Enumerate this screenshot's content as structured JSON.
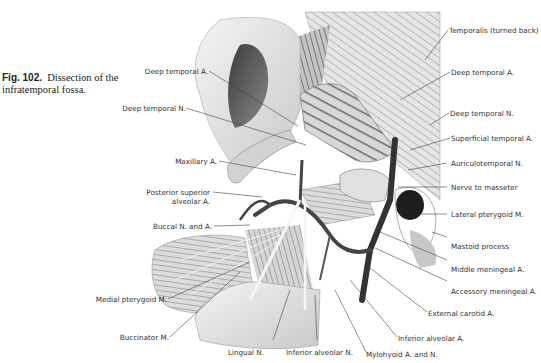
{
  "figure": {
    "number": "Fig. 102.",
    "caption": "Dissection of the infratemporal fossa."
  },
  "labels": {
    "left": [
      {
        "id": "deep-temporal-a-left",
        "text": "Deep temporal A."
      },
      {
        "id": "deep-temporal-n-left",
        "text": "Deep temporal N."
      },
      {
        "id": "maxillary-a",
        "text": "Maxillary A."
      },
      {
        "id": "posterior-superior-alveolar-a-1",
        "text": "Posterior superior"
      },
      {
        "id": "posterior-superior-alveolar-a-2",
        "text": "alveolar A."
      },
      {
        "id": "buccal-n-and-a",
        "text": "Buccal N. and A."
      },
      {
        "id": "medial-pterygoid-m",
        "text": "Medial pterygoid M."
      },
      {
        "id": "buccinator-m",
        "text": "Buccinator M."
      }
    ],
    "right": [
      {
        "id": "temporalis",
        "text": "Temporalis (turned back)"
      },
      {
        "id": "deep-temporal-a-right",
        "text": "Deep temporal A."
      },
      {
        "id": "deep-temporal-n-right",
        "text": "Deep temporal N."
      },
      {
        "id": "superficial-temporal-a",
        "text": "Superficial temporal A."
      },
      {
        "id": "auriculotemporal-n",
        "text": "Auriculotemporal N."
      },
      {
        "id": "nerve-to-masseter",
        "text": "Nerve to masseter"
      },
      {
        "id": "lateral-pterygoid-m",
        "text": "Lateral pterygoid M."
      },
      {
        "id": "mastoid-process",
        "text": "Mastoid process"
      },
      {
        "id": "middle-meningeal-a",
        "text": "Middle meningeal A."
      },
      {
        "id": "accessory-meningeal-a",
        "text": "Accessory meningeal A."
      },
      {
        "id": "external-carotid-a",
        "text": "External carotid A."
      },
      {
        "id": "inferior-alveolar-a",
        "text": "Inferior alveolar A."
      },
      {
        "id": "mylohyoid-a-and-n",
        "text": "Mylohyoid A. and N."
      }
    ],
    "bottom": [
      {
        "id": "lingual-n",
        "text": "Lingual N."
      },
      {
        "id": "inferior-alveolar-n",
        "text": "Inferior alveolar N."
      }
    ]
  }
}
